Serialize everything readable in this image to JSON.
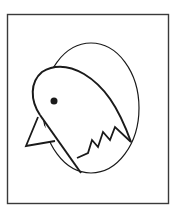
{
  "illustration": {
    "subject": "chick hatching from egg",
    "style": "black line drawing",
    "colors": {
      "background": "#ffffff",
      "stroke": "#1a1a1a",
      "frame": "#3a3a3a"
    },
    "frame": {
      "x": 7,
      "y": 14,
      "width": 161,
      "height": 189
    },
    "egg": {
      "cx": 91,
      "cy": 108,
      "rx": 48,
      "ry": 65
    },
    "eye": {
      "cx": 54,
      "cy": 101,
      "r": 3.5
    }
  }
}
